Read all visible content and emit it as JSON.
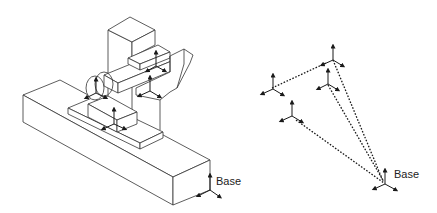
{
  "figure": {
    "left_panel": {
      "description": "Isometric machine tool with coordinate frames attached to its components",
      "base_label": "Base",
      "frames": [
        {
          "name": "spindle-head-frame"
        },
        {
          "name": "column-frame"
        },
        {
          "name": "rotary-tool-frame"
        },
        {
          "name": "workpiece-frame"
        },
        {
          "name": "base-frame"
        }
      ]
    },
    "right_panel": {
      "description": "Coordinate frames connected by dotted kinematic chain lines",
      "base_label": "Base",
      "frames": [
        {
          "name": "frame-top"
        },
        {
          "name": "frame-upper-right"
        },
        {
          "name": "frame-left"
        },
        {
          "name": "frame-lower-left"
        },
        {
          "name": "base-frame"
        }
      ]
    },
    "colors": {
      "line": "#1a1a1a",
      "background": "#ffffff"
    }
  }
}
